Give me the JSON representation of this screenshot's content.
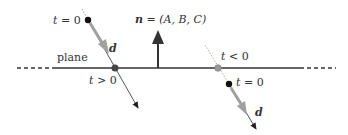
{
  "diagram": {
    "type": "ray-plane intersection",
    "plane_label": "plane",
    "normal": {
      "symbol": "n",
      "equals": " = ",
      "components": "(A, B, C)"
    },
    "left_ray": {
      "start_label_var": "t",
      "start_label_rest": " = 0",
      "direction_label": "d",
      "intersection_label_var": "t",
      "intersection_label_rest": " > 0"
    },
    "right_ray": {
      "start_label_var": "t",
      "start_label_rest": " = 0",
      "direction_label": "d",
      "intersection_label_var": "t",
      "intersection_label_rest": " < 0"
    },
    "colors": {
      "line": "#333333",
      "direction_arrow": "#a0a0a0",
      "point": "#111111",
      "intersection_point": "#444444",
      "behind_intersection_point": "#999999"
    }
  }
}
